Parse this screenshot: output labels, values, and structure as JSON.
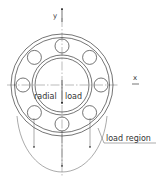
{
  "diagram": {
    "type": "ball-bearing-load-distribution",
    "colors": {
      "line": "#3a3a3a",
      "background": "#ffffff"
    },
    "axes": {
      "y_label": "y",
      "x_label": "x"
    },
    "labels": {
      "radial_left": "radial",
      "radial_right": "load",
      "load_region": "load region"
    },
    "geometry": {
      "center": [
        62,
        85
      ],
      "outer_ring_radii": [
        51,
        47.5
      ],
      "inner_ring_radii": [
        30,
        27
      ],
      "ball_pitch_radius": 39,
      "ball_radius": 7,
      "ball_count": 8
    }
  }
}
